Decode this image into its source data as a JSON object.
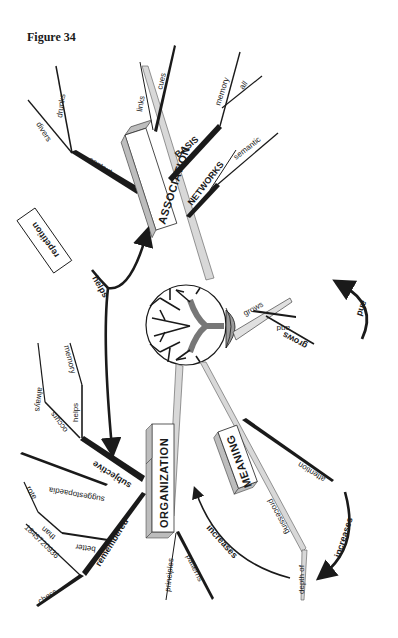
{
  "figure": {
    "title": "Figure 34"
  },
  "center": {
    "icon": "tree-icon"
  },
  "colors": {
    "ink": "#1a1a1a",
    "branch_gray": "#d8d8d8",
    "box_side": "#bdbdbd",
    "paper": "#ffffff"
  },
  "main_branches": {
    "association": {
      "label": "ASSOCIATION",
      "sub": {
        "basis": {
          "label": "BASIS",
          "children": [
            "memory",
            "all"
          ]
        },
        "networks": {
          "label": "NETWORKS",
          "children": [
            "semantic"
          ]
        },
        "links": "links",
        "cues": "cues",
        "context": {
          "label": "context",
          "children": [
            "drunks",
            "divers"
          ]
        }
      }
    },
    "organization": {
      "label": "ORGANIZATION",
      "sub": {
        "subjective": {
          "label": "subjective",
          "children": [
            "occurs",
            "always",
            "helps",
            "memory",
            "suggestopaedia"
          ]
        },
        "remembered": {
          "label": "remembered",
          "children": [
            "better",
            "than",
            "rote",
            "chess",
            "1845720936"
          ]
        },
        "principles": "principles",
        "patterns": "patterns"
      }
    },
    "meaning": {
      "label": "MEANING",
      "sub": {
        "attention": "attention",
        "processing": "processing",
        "depth_of": "depth of"
      }
    },
    "grows": {
      "label": "grows",
      "children": [
        "and",
        "grows"
      ],
      "arrow_label": "and"
    }
  },
  "connectors": {
    "repetition_box": "repetition",
    "helps": "helps",
    "increases_left": "increases",
    "increases_right": "increases"
  }
}
